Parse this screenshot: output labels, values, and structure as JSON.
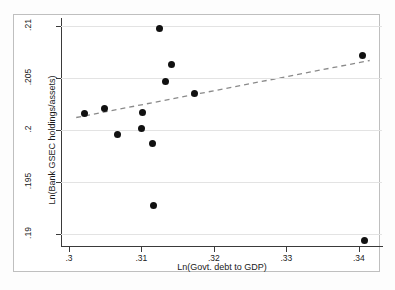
{
  "chart_data": {
    "type": "scatter",
    "title": "",
    "xlabel": "Ln(Govt. debt to GDP)",
    "ylabel": "Ln(Bank GSEC holdings/assets)",
    "xlim": [
      0.2989,
      0.3432
    ],
    "ylim": [
      0.1888,
      0.2108
    ],
    "xticks": [
      0.3,
      0.31,
      0.32,
      0.33,
      0.34
    ],
    "xtick_labels": [
      ".3",
      ".31",
      ".32",
      ".33",
      ".34"
    ],
    "yticks": [
      0.19,
      0.195,
      0.2,
      0.205,
      0.21
    ],
    "ytick_labels": [
      ".19",
      ".195",
      ".2",
      ".205",
      ".21"
    ],
    "grid": "horizontal",
    "legend": "none",
    "marker_color": "#111111",
    "points": [
      {
        "x": 0.3021,
        "y": 0.2016
      },
      {
        "x": 0.3049,
        "y": 0.2021
      },
      {
        "x": 0.3067,
        "y": 0.1996
      },
      {
        "x": 0.31,
        "y": 0.2001
      },
      {
        "x": 0.3102,
        "y": 0.2017
      },
      {
        "x": 0.3115,
        "y": 0.1987
      },
      {
        "x": 0.3117,
        "y": 0.1927
      },
      {
        "x": 0.3125,
        "y": 0.2098
      },
      {
        "x": 0.3133,
        "y": 0.2047
      },
      {
        "x": 0.3142,
        "y": 0.2063
      },
      {
        "x": 0.3173,
        "y": 0.2035
      },
      {
        "x": 0.3405,
        "y": 0.2072
      },
      {
        "x": 0.3408,
        "y": 0.1893
      }
    ],
    "fit_line": {
      "style": "dashed",
      "color": "#8a8a8a",
      "x_start": 0.301,
      "y_start": 0.2012,
      "x_end": 0.3415,
      "y_end": 0.2067
    }
  }
}
